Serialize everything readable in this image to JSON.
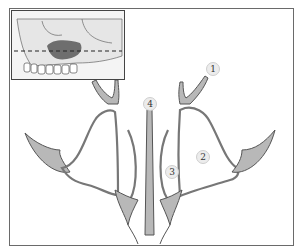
{
  "figure": {
    "type": "anatomical-diagram",
    "inset": {
      "description": "lateral skull view with highlighted maxillary sinus and dashed section line",
      "highlight_color": "#6e6e6e",
      "section_line": "dashed-arrow-both-ends"
    },
    "labels": [
      {
        "id": "1",
        "text": "1"
      },
      {
        "id": "2",
        "text": "2"
      },
      {
        "id": "3",
        "text": "3"
      },
      {
        "id": "4",
        "text": "4"
      }
    ],
    "colors": {
      "bone_fill": "#b5b5b5",
      "outline": "#555555",
      "border": "#6a6a6a"
    }
  }
}
